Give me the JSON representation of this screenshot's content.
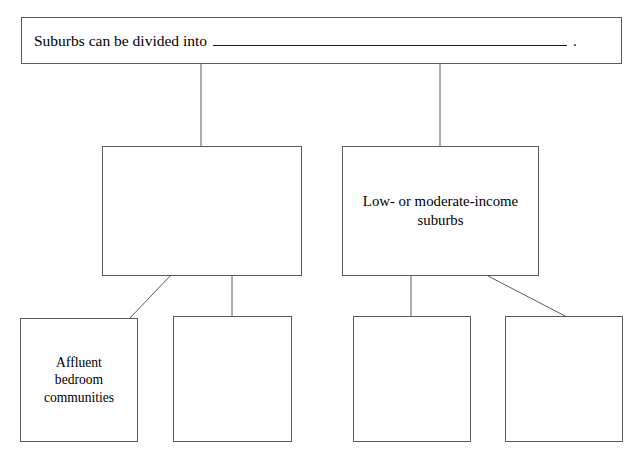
{
  "diagram": {
    "type": "hierarchy-tree",
    "stroke_color": "#5a5a5a",
    "text_color": "#000000",
    "background_color": "#ffffff",
    "root": {
      "prompt_prefix": "Suburbs can be divided into",
      "blank_answer": "",
      "punctuation": "."
    },
    "mid": [
      {
        "id": "mid-left",
        "label": ""
      },
      {
        "id": "mid-right",
        "label": "Low- or moderate-income\nsuburbs"
      }
    ],
    "leaves": [
      {
        "id": "leaf-1",
        "label": "Affluent\nbedroom\ncommunities"
      },
      {
        "id": "leaf-2",
        "label": ""
      },
      {
        "id": "leaf-3",
        "label": ""
      },
      {
        "id": "leaf-4",
        "label": ""
      }
    ]
  }
}
